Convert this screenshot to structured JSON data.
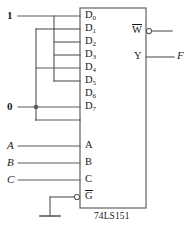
{
  "diagram": {
    "chip": {
      "part_number": "74LS151",
      "box": {
        "x": 80,
        "y": 8,
        "width": 66,
        "height": 200
      },
      "stroke_color": "#5a5a5a",
      "data_pins": [
        {
          "name": "D0",
          "base": "D",
          "sub": "0",
          "y": 16
        },
        {
          "name": "D1",
          "base": "D",
          "sub": "1",
          "y": 29
        },
        {
          "name": "D2",
          "base": "D",
          "sub": "2",
          "y": 42
        },
        {
          "name": "D3",
          "base": "D",
          "sub": "3",
          "y": 55
        },
        {
          "name": "D4",
          "base": "D",
          "sub": "4",
          "y": 68
        },
        {
          "name": "D5",
          "base": "D",
          "sub": "5",
          "y": 81
        },
        {
          "name": "D6",
          "base": "D",
          "sub": "6",
          "y": 94
        },
        {
          "name": "D7",
          "base": "D",
          "sub": "7",
          "y": 107
        }
      ],
      "select_pins": [
        {
          "name": "A",
          "label": "A",
          "y": 146
        },
        {
          "name": "B",
          "label": "B",
          "y": 163
        },
        {
          "name": "C",
          "label": "C",
          "y": 180
        }
      ],
      "enable_pin": {
        "name": "G-bar",
        "label": "G",
        "overbar": true,
        "y": 197,
        "bubble": true
      },
      "output_pins": [
        {
          "name": "W-bar",
          "label": "W",
          "overbar": true,
          "y": 31,
          "bubble": true
        },
        {
          "name": "Y",
          "label": "Y",
          "overbar": false,
          "y": 57,
          "bubble": false
        }
      ]
    },
    "drivers": [
      {
        "name": "logic-one",
        "label": "1",
        "y": 16,
        "x": 8,
        "bold": true
      },
      {
        "name": "logic-zero",
        "label": "0",
        "y": 107,
        "x": 8,
        "bold": true
      }
    ],
    "select_inputs": [
      {
        "name": "A",
        "label": "A",
        "y": 146,
        "x": 8
      },
      {
        "name": "B",
        "label": "B",
        "y": 163,
        "x": 8
      },
      {
        "name": "C",
        "label": "C",
        "y": 180,
        "x": 8
      }
    ],
    "output_signal": {
      "name": "F",
      "label": "F",
      "y": 57,
      "x": 178
    },
    "ground": {
      "name": "ground-symbol",
      "x": 50,
      "y": 218
    },
    "wiring": {
      "bus_one_x": 54,
      "bus_zero_x": 36,
      "one_pins": [
        "D0",
        "D1",
        "D2",
        "D3",
        "D5"
      ],
      "zero_pins": [
        "D4",
        "D6",
        "D7"
      ],
      "junction_dots": [
        {
          "x": 36,
          "y": 107
        }
      ]
    }
  }
}
